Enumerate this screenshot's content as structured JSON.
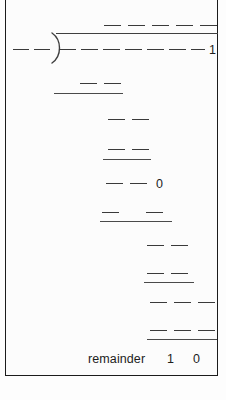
{
  "worksheet": {
    "type": "long-division",
    "title": "Long division blank-fill exercise",
    "background_color": "#fcfcfc",
    "ink_color": "#1d1d1d",
    "border_color": "#1b1b1b",
    "blank_mark": "—"
  },
  "quotient": {
    "label": "quotient",
    "blanks": 5,
    "filled_digits": []
  },
  "divisor": {
    "label": "divisor",
    "blanks": 2,
    "filled_digits": []
  },
  "dividend": {
    "label": "dividend",
    "blanks": 7,
    "trailing_digit": "1"
  },
  "bracket": {
    "glyph": ")",
    "name": "division-bracket"
  },
  "work_rows": [
    {
      "row": 1,
      "blanks": 2,
      "digits": [],
      "underline": true,
      "align": "left-mid"
    },
    {
      "row": 2,
      "blanks": 2,
      "digits": [],
      "underline": false,
      "align": "mid"
    },
    {
      "row": 3,
      "blanks": 2,
      "digits": [],
      "underline": true,
      "align": "mid"
    },
    {
      "row": 4,
      "blanks": 2,
      "digits": [
        "1"
      ],
      "underline": false,
      "align": "mid"
    },
    {
      "row": 5,
      "blanks": 2,
      "digits": [
        "0"
      ],
      "underline": true,
      "align": "mid"
    },
    {
      "row": 6,
      "blanks": 2,
      "digits": [],
      "underline": false,
      "align": "right"
    },
    {
      "row": 7,
      "blanks": 2,
      "digits": [],
      "underline": true,
      "align": "right"
    },
    {
      "row": 8,
      "blanks": 3,
      "digits": [],
      "underline": false,
      "align": "right"
    },
    {
      "row": 9,
      "blanks": 3,
      "digits": [],
      "underline": true,
      "align": "right"
    }
  ],
  "remainder": {
    "label": "remainder",
    "digits": [
      "1",
      "0"
    ]
  }
}
